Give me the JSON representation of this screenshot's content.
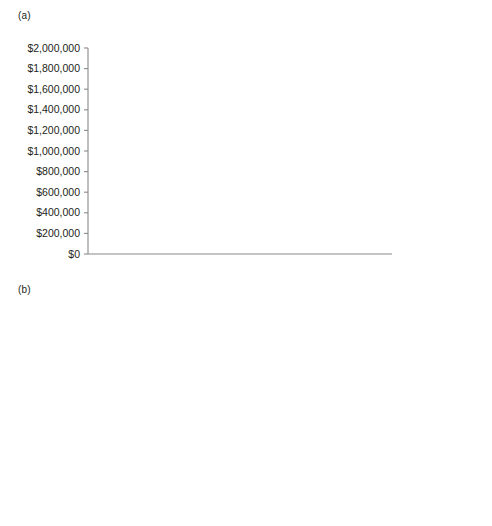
{
  "figure": {
    "panel_a_label": "(a)",
    "panel_b_label": "(b)"
  },
  "colors": {
    "series_blue": "#5b6bab",
    "series_orange": "#e8714a",
    "axis": "#8a8a8a",
    "text": "#231f20",
    "background": "#ffffff"
  },
  "chart_data": [
    {
      "id": "panel-a",
      "type": "line",
      "title": "(a)",
      "xlabel": "",
      "ylabel": "",
      "grid": false,
      "legend_position": "top-right",
      "x": [
        0,
        1,
        2,
        3,
        4,
        5,
        6,
        7,
        8,
        9,
        10
      ],
      "xtick_labels": [
        "0%",
        "1%",
        "2%",
        "3%",
        "4%",
        "5%",
        "6%",
        "7%",
        "8%",
        "9%",
        "10%"
      ],
      "xlim": [
        0,
        10
      ],
      "ylim": [
        0,
        2000000
      ],
      "ytick_labels": [
        "$0",
        "$200,000",
        "$400,000",
        "$600,000",
        "$800,000",
        "$1,000,000",
        "$1,200,000",
        "$1,400,000",
        "$1,600,000",
        "$1,800,000",
        "$2,000,000"
      ],
      "ytick_values": [
        0,
        200000,
        400000,
        600000,
        800000,
        1000000,
        1200000,
        1400000,
        1600000,
        1800000,
        2000000
      ],
      "series": [
        {
          "name": "Value of\nhuman capital",
          "legend_label": "Value of\nhuman capital",
          "color": "#5b6bab",
          "marker": "circle",
          "values": [
            1800000,
            1550000,
            1350000,
            1185000,
            1045000,
            930000,
            835000,
            755000,
            690000,
            635000,
            590000
          ]
        }
      ]
    },
    {
      "id": "panel-b",
      "type": "line",
      "title": "(b)",
      "xlabel": "",
      "ylabel": "",
      "grid": false,
      "legend_position": "top-right",
      "x": [
        0,
        1,
        2,
        3,
        4,
        5,
        6,
        7,
        8,
        9,
        10
      ],
      "xtick_labels": [
        "0%",
        "2%",
        "4%",
        "6%",
        "8%",
        "10%",
        "12%"
      ],
      "xtick_values": [
        0,
        2,
        4,
        6,
        8,
        10,
        12
      ],
      "xlim": [
        0,
        12
      ],
      "ylim": [
        0,
        70000
      ],
      "ytick_labels": [
        "$0",
        "$10,000",
        "$20,000",
        "$30,000",
        "$40,000",
        "$50,000",
        "$60,000",
        "$70,000"
      ],
      "ytick_values": [
        0,
        10000,
        20000,
        30000,
        40000,
        50000,
        60000,
        70000
      ],
      "series": [
        {
          "name": "Consumption",
          "legend_label": "Consumption",
          "color": "#5b6bab",
          "marker": "circle",
          "values": [
            40000,
            43000,
            45500,
            47800,
            50000,
            52000,
            53600,
            55100,
            56000,
            57000,
            57800
          ]
        },
        {
          "name": "Saving",
          "legend_label": "Saving",
          "color": "#e8714a",
          "marker": "square",
          "values": [
            20000,
            17600,
            15500,
            13500,
            11800,
            10000,
            8200,
            7000,
            6000,
            5000,
            4200
          ]
        }
      ]
    }
  ]
}
